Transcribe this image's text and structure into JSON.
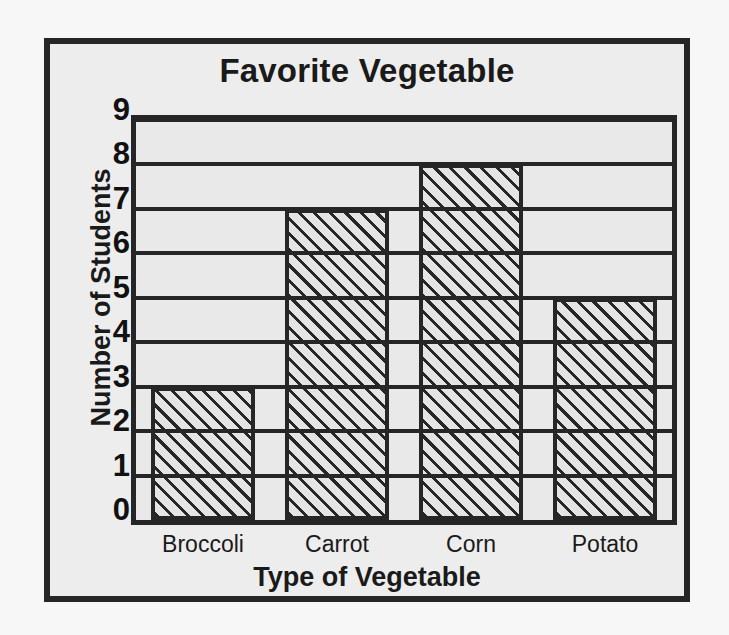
{
  "chart_data": {
    "type": "bar",
    "title": "Favorite Vegetable",
    "xlabel": "Type of Vegetable",
    "ylabel": "Number of Students",
    "categories": [
      "Broccoli",
      "Carrot",
      "Corn",
      "Potato"
    ],
    "values": [
      3,
      7,
      8,
      5
    ],
    "ylim": [
      0,
      9
    ],
    "ytick_labels": [
      "0",
      "1",
      "2",
      "3",
      "4",
      "5",
      "6",
      "7",
      "8",
      "9"
    ],
    "ytick_values": [
      0,
      1,
      2,
      3,
      4,
      5,
      6,
      7,
      8,
      9
    ],
    "grid": true,
    "grid_axis": "y",
    "legend": false,
    "bar_fill": "diagonal-hatch",
    "colors": {
      "ink": "#262626",
      "plot_background": "#e9e9e9",
      "frame_background": "#ededed",
      "page_background": "#f7f7f7",
      "bar_fill": "#e4e4e4",
      "text": "#1a1a1a"
    }
  }
}
